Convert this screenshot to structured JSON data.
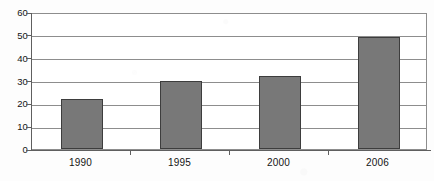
{
  "chart_data": {
    "type": "bar",
    "title": "",
    "subtitle": "",
    "xlabel": "",
    "ylabel": "",
    "categories": [
      "1990",
      "1995",
      "2000",
      "2006"
    ],
    "values": [
      22,
      30,
      32,
      49
    ],
    "series": [
      {
        "name": "",
        "values": [
          22,
          30,
          32,
          49
        ]
      }
    ],
    "ylim": [
      0,
      60
    ],
    "ytick_labels": [
      "0",
      "10",
      "20",
      "30",
      "40",
      "50",
      "60"
    ],
    "ytick_values": [
      0,
      10,
      20,
      30,
      40,
      50,
      60
    ],
    "grid": true,
    "legend": false,
    "legend_position": "none",
    "annotations": [],
    "colors": {
      "bar_fill": "#787878",
      "bar_border": "#3d3d3d",
      "gridline": "#8d8d8d",
      "axis": "#5f5f5f",
      "text": "#141414",
      "background": "#fdfdfd",
      "plot_background": "#ffffff"
    }
  }
}
